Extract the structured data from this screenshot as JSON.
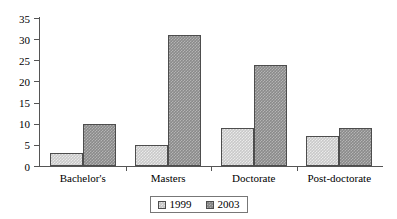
{
  "chart_data": {
    "type": "bar",
    "title": "",
    "xlabel": "",
    "ylabel": "",
    "ylim": [
      0,
      35
    ],
    "ytick_step": 5,
    "yticks": [
      0,
      5,
      10,
      15,
      20,
      25,
      30,
      35
    ],
    "grid": false,
    "legend_position": "bottom",
    "categories": [
      "Bachelor's",
      "Masters",
      "Doctorate",
      "Post-doctorate"
    ],
    "series": [
      {
        "name": "1999",
        "color": "#c9c9c9",
        "values": [
          3,
          5,
          9,
          7
        ]
      },
      {
        "name": "2003",
        "color": "#8a8a8a",
        "values": [
          10,
          31,
          24,
          9
        ]
      }
    ]
  },
  "legend": {
    "items": [
      {
        "label": "1999",
        "swatch": "light-gray-hatched"
      },
      {
        "label": "2003",
        "swatch": "dark-gray-hatched"
      }
    ]
  },
  "colors": {
    "series_1999": "#c9c9c9",
    "series_2003": "#8a8a8a",
    "axis": "#555555",
    "bar_border": "#4d4d4d",
    "background": "#ffffff",
    "text": "#000000"
  }
}
